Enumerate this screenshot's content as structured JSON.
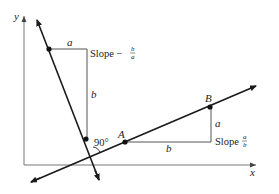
{
  "diagram": {
    "axes": {
      "x_label": "x",
      "y_label": "y"
    },
    "steep_line": {
      "slope_text": "Slope −",
      "slope_num": "b",
      "slope_den": "a",
      "run_label": "a",
      "rise_label": "b"
    },
    "shallow_line": {
      "slope_text": "Slope",
      "slope_num": "a",
      "slope_den": "b",
      "run_label": "b",
      "rise_label": "a",
      "point_a": "A",
      "point_b": "B"
    },
    "angle_label": "90°",
    "colors": {
      "line": "#1a1a1a",
      "guide": "#555555",
      "axis": "#777777"
    }
  }
}
